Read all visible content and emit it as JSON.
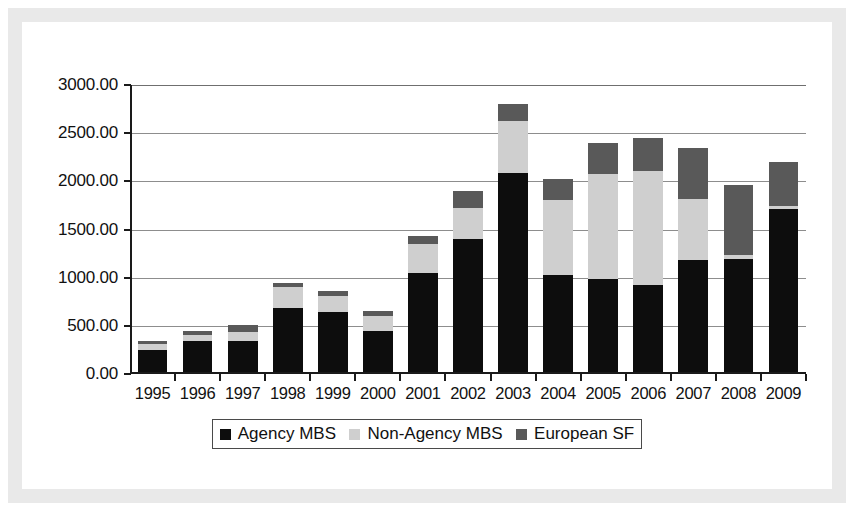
{
  "chart_data": {
    "type": "bar",
    "stacked": true,
    "title": "",
    "xlabel": "",
    "ylabel": "",
    "ylim": [
      0,
      3000
    ],
    "ytick_step": 500,
    "grid": true,
    "legend_position": "bottom",
    "categories": [
      "1995",
      "1996",
      "1997",
      "1998",
      "1999",
      "2000",
      "2001",
      "2002",
      "2003",
      "2004",
      "2005",
      "2006",
      "2007",
      "2008",
      "2009"
    ],
    "ytick_labels": [
      "0.00",
      "500.00",
      "1000.00",
      "1500.00",
      "2000.00",
      "2500.00",
      "3000.00"
    ],
    "series": [
      {
        "name": "Agency MBS",
        "color": "#0d0d0d",
        "values": [
          250,
          340,
          340,
          690,
          640,
          450,
          1050,
          1400,
          2090,
          1030,
          990,
          920,
          1180,
          1190,
          1710
        ]
      },
      {
        "name": "Non-Agency MBS",
        "color": "#cfcfcf",
        "values": [
          60,
          60,
          95,
          215,
          170,
          155,
          300,
          320,
          540,
          780,
          1090,
          1190,
          640,
          50,
          30
        ]
      },
      {
        "name": "European SF",
        "color": "#595959",
        "values": [
          30,
          50,
          70,
          40,
          50,
          50,
          80,
          180,
          170,
          210,
          320,
          340,
          530,
          720,
          460
        ]
      }
    ],
    "totals": [
      340,
      450,
      505,
      945,
      860,
      655,
      1430,
      1900,
      2800,
      2020,
      2400,
      2450,
      2350,
      1960,
      2200
    ]
  },
  "legend": {
    "items": [
      {
        "label": "Agency MBS",
        "swatch": "agency"
      },
      {
        "label": "Non-Agency MBS",
        "swatch": "nonagency"
      },
      {
        "label": "European SF",
        "swatch": "euro"
      }
    ]
  },
  "colors": {
    "agency": "#0d0d0d",
    "non_agency": "#cfcfcf",
    "european_sf": "#595959",
    "gridline": "#8d8d8d",
    "axis": "#1a1a1a",
    "page_background": "#ffffff",
    "scan_border": "#e9e9e9"
  }
}
